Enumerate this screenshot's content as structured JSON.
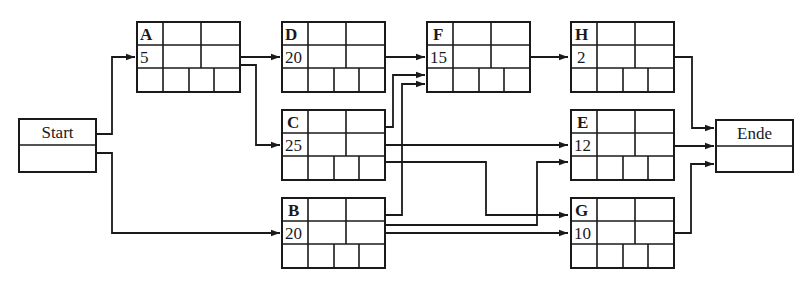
{
  "diagram": {
    "type": "activity-on-node network (Netzplan)",
    "colors": {
      "line": "#1a1a1a",
      "background": "#ffffff"
    },
    "start": {
      "label": "Start"
    },
    "end": {
      "label": "Ende"
    },
    "nodes": [
      {
        "id": "A",
        "duration": "5"
      },
      {
        "id": "D",
        "duration": "20"
      },
      {
        "id": "F",
        "duration": "15"
      },
      {
        "id": "H",
        "duration": "2"
      },
      {
        "id": "C",
        "duration": "25"
      },
      {
        "id": "E",
        "duration": "12"
      },
      {
        "id": "B",
        "duration": "20"
      },
      {
        "id": "G",
        "duration": "10"
      }
    ],
    "edges": [
      {
        "from": "Start",
        "to": "A"
      },
      {
        "from": "Start",
        "to": "B"
      },
      {
        "from": "A",
        "to": "D"
      },
      {
        "from": "A",
        "to": "C"
      },
      {
        "from": "D",
        "to": "F"
      },
      {
        "from": "C",
        "to": "F"
      },
      {
        "from": "B",
        "to": "F"
      },
      {
        "from": "C",
        "to": "E"
      },
      {
        "from": "C",
        "to": "G"
      },
      {
        "from": "B",
        "to": "E"
      },
      {
        "from": "B",
        "to": "G"
      },
      {
        "from": "F",
        "to": "H"
      },
      {
        "from": "H",
        "to": "Ende"
      },
      {
        "from": "E",
        "to": "Ende"
      },
      {
        "from": "G",
        "to": "Ende"
      }
    ]
  }
}
